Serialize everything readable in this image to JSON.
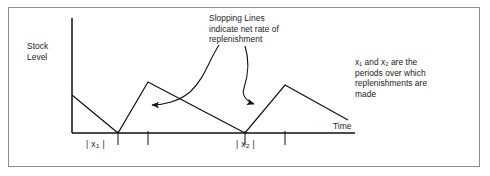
{
  "figure": {
    "axes": {
      "y_label": "Stock\nLevel",
      "x_label": "Time"
    },
    "annotations": {
      "slopping_lines": "Slopping Lines\nindicate net rate of\nreplenishment",
      "periods": "x₁ and x₂ are the\nperiods over which\nreplenishments are\nmade"
    },
    "period_markers": [
      {
        "name": "x1",
        "base": "x",
        "sub": "1",
        "bracket_left": "|",
        "bracket_right": "|"
      },
      {
        "name": "x2",
        "base": "x",
        "sub": "2",
        "bracket_left": "|",
        "bracket_right": "|"
      }
    ],
    "colors": {
      "line": "#111111",
      "axis": "#111111",
      "border": "#8d8d8d",
      "background": "#ffffff",
      "text": "#1a1a1a"
    }
  },
  "chart_data": {
    "type": "line",
    "title": "",
    "xlabel": "Time",
    "ylabel": "Stock Level",
    "grid": false,
    "legend": null,
    "axis_pixels": {
      "y_axis_x": 72,
      "y_axis_top": 18,
      "x_axis_y": 133,
      "x_axis_right": 355
    },
    "series": [
      {
        "name": "stock level",
        "points": [
          {
            "x": 72,
            "y": 95
          },
          {
            "x": 118,
            "y": 133
          },
          {
            "x": 148,
            "y": 82
          },
          {
            "x": 245,
            "y": 133
          },
          {
            "x": 285,
            "y": 85
          },
          {
            "x": 348,
            "y": 120
          }
        ]
      }
    ],
    "replenishment_periods": [
      {
        "label": "x1",
        "x_start": 118,
        "x_end": 148
      },
      {
        "label": "x2",
        "x_start": 245,
        "x_end": 285
      }
    ],
    "leader_arrows": [
      {
        "from_annotation": "slopping_lines",
        "target_x": 145,
        "target_y": 105
      },
      {
        "from_annotation": "slopping_lines",
        "target_x": 261,
        "target_y": 104
      }
    ]
  }
}
